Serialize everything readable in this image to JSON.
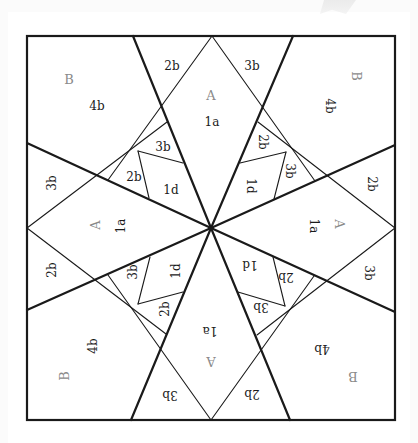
{
  "diagram": {
    "colors": {
      "background": "#ffffff",
      "line": "#1a1a1a",
      "piece_label": "#1a1a1a",
      "template_label": "#8a8a8a"
    },
    "square": {
      "x1": 27,
      "y1": 36,
      "x2": 395,
      "y2": 420
    },
    "center": {
      "x": 211,
      "y": 228
    },
    "bold_lines": [
      {
        "name": "spoke-top-left",
        "from": [
          133,
          36
        ],
        "to": [
          211,
          228
        ]
      },
      {
        "name": "spoke-top-right",
        "from": [
          293,
          36
        ],
        "to": [
          211,
          228
        ]
      },
      {
        "name": "spoke-left-top",
        "from": [
          27,
          143
        ],
        "to": [
          211,
          228
        ]
      },
      {
        "name": "spoke-left-bottom",
        "from": [
          27,
          310
        ],
        "to": [
          211,
          228
        ]
      },
      {
        "name": "spoke-right-top",
        "from": [
          395,
          145
        ],
        "to": [
          211,
          228
        ]
      },
      {
        "name": "spoke-right-bottom",
        "from": [
          395,
          312
        ],
        "to": [
          211,
          228
        ]
      },
      {
        "name": "spoke-bottom-left",
        "from": [
          131,
          420
        ],
        "to": [
          211,
          228
        ]
      },
      {
        "name": "spoke-bottom-right",
        "from": [
          290,
          420
        ],
        "to": [
          211,
          228
        ]
      }
    ],
    "thin_lines": [
      {
        "name": "diamond-top-left-edge",
        "from": [
          212,
          36
        ],
        "to": [
          108,
          180
        ]
      },
      {
        "name": "diamond-top-right-edge",
        "from": [
          212,
          36
        ],
        "to": [
          315,
          181
        ]
      },
      {
        "name": "diamond-left-upper-edge",
        "from": [
          27,
          228
        ],
        "to": [
          167,
          122
        ]
      },
      {
        "name": "diamond-left-lower-edge",
        "from": [
          27,
          228
        ],
        "to": [
          166,
          334
        ]
      },
      {
        "name": "diamond-right-upper-edge",
        "from": [
          395,
          228
        ],
        "to": [
          258,
          122
        ]
      },
      {
        "name": "diamond-right-lower-edge",
        "from": [
          395,
          228
        ],
        "to": [
          257,
          335
        ]
      },
      {
        "name": "diamond-bottom-left-edge",
        "from": [
          211,
          420
        ],
        "to": [
          108,
          275
        ]
      },
      {
        "name": "diamond-bottom-right-edge",
        "from": [
          211,
          420
        ],
        "to": [
          314,
          276
        ]
      },
      {
        "name": "tl-3b-1d-divider",
        "from": [
          138,
          151
        ],
        "to": [
          183,
          163
        ]
      },
      {
        "name": "tl-2b-1d-divider",
        "from": [
          138,
          151
        ],
        "to": [
          149,
          198
        ]
      },
      {
        "name": "tr-2b-1d-divider",
        "from": [
          286,
          152
        ],
        "to": [
          240,
          163
        ]
      },
      {
        "name": "tr-3b-1d-divider",
        "from": [
          286,
          152
        ],
        "to": [
          274,
          199
        ]
      },
      {
        "name": "bl-3b-1d-divider",
        "from": [
          138,
          304
        ],
        "to": [
          150,
          257
        ]
      },
      {
        "name": "bl-2b-1d-divider",
        "from": [
          138,
          304
        ],
        "to": [
          183,
          292
        ]
      },
      {
        "name": "br-2b-1d-divider",
        "from": [
          285,
          306
        ],
        "to": [
          273,
          257
        ]
      },
      {
        "name": "br-3b-1d-divider",
        "from": [
          285,
          306
        ],
        "to": [
          238,
          292
        ]
      }
    ],
    "labels": [
      {
        "text": "2b",
        "x": 172,
        "y": 66,
        "rot": 0,
        "kind": "piece"
      },
      {
        "text": "A",
        "x": 211,
        "y": 96,
        "rot": 0,
        "kind": "template"
      },
      {
        "text": "1a",
        "x": 212,
        "y": 122,
        "rot": 0,
        "kind": "piece"
      },
      {
        "text": "3b",
        "x": 252,
        "y": 66,
        "rot": 0,
        "kind": "piece"
      },
      {
        "text": "B",
        "x": 69,
        "y": 80,
        "rot": 0,
        "kind": "template"
      },
      {
        "text": "4b",
        "x": 97,
        "y": 106,
        "rot": 0,
        "kind": "piece"
      },
      {
        "text": "3b",
        "x": 163,
        "y": 147,
        "rot": 0,
        "kind": "piece"
      },
      {
        "text": "2b",
        "x": 134,
        "y": 177,
        "rot": 0,
        "kind": "piece"
      },
      {
        "text": "1d",
        "x": 171,
        "y": 190,
        "rot": 0,
        "kind": "piece"
      },
      {
        "text": "2b",
        "x": 262,
        "y": 142,
        "rot": 90,
        "kind": "piece"
      },
      {
        "text": "3b",
        "x": 289,
        "y": 171,
        "rot": 90,
        "kind": "piece"
      },
      {
        "text": "1d",
        "x": 250,
        "y": 186,
        "rot": 90,
        "kind": "piece"
      },
      {
        "text": "B",
        "x": 355,
        "y": 76,
        "rot": 90,
        "kind": "template"
      },
      {
        "text": "4b",
        "x": 329,
        "y": 106,
        "rot": 90,
        "kind": "piece"
      },
      {
        "text": "2b",
        "x": 371,
        "y": 184,
        "rot": 90,
        "kind": "piece"
      },
      {
        "text": "A",
        "x": 338,
        "y": 224,
        "rot": 90,
        "kind": "template"
      },
      {
        "text": "1a",
        "x": 313,
        "y": 226,
        "rot": 90,
        "kind": "piece"
      },
      {
        "text": "3b",
        "x": 368,
        "y": 273,
        "rot": 90,
        "kind": "piece"
      },
      {
        "text": "3b",
        "x": 52,
        "y": 183,
        "rot": -90,
        "kind": "piece"
      },
      {
        "text": "A",
        "x": 96,
        "y": 225,
        "rot": -90,
        "kind": "template"
      },
      {
        "text": "1a",
        "x": 121,
        "y": 226,
        "rot": -90,
        "kind": "piece"
      },
      {
        "text": "2b",
        "x": 52,
        "y": 270,
        "rot": -90,
        "kind": "piece"
      },
      {
        "text": "3b",
        "x": 133,
        "y": 272,
        "rot": -90,
        "kind": "piece"
      },
      {
        "text": "1d",
        "x": 176,
        "y": 271,
        "rot": -90,
        "kind": "piece"
      },
      {
        "text": "2b",
        "x": 165,
        "y": 309,
        "rot": -90,
        "kind": "piece"
      },
      {
        "text": "4b",
        "x": 93,
        "y": 346,
        "rot": -90,
        "kind": "piece"
      },
      {
        "text": "B",
        "x": 65,
        "y": 376,
        "rot": -90,
        "kind": "template"
      },
      {
        "text": "1a",
        "x": 210,
        "y": 330,
        "rot": 180,
        "kind": "piece"
      },
      {
        "text": "A",
        "x": 211,
        "y": 360,
        "rot": 180,
        "kind": "template"
      },
      {
        "text": "3b",
        "x": 170,
        "y": 394,
        "rot": 180,
        "kind": "piece"
      },
      {
        "text": "2b",
        "x": 252,
        "y": 393,
        "rot": 180,
        "kind": "piece"
      },
      {
        "text": "1d",
        "x": 250,
        "y": 264,
        "rot": 180,
        "kind": "piece"
      },
      {
        "text": "2b",
        "x": 286,
        "y": 276,
        "rot": 180,
        "kind": "piece"
      },
      {
        "text": "3b",
        "x": 261,
        "y": 306,
        "rot": 180,
        "kind": "piece"
      },
      {
        "text": "4b",
        "x": 322,
        "y": 348,
        "rot": 180,
        "kind": "piece"
      },
      {
        "text": "B",
        "x": 353,
        "y": 375,
        "rot": 180,
        "kind": "template"
      }
    ]
  }
}
